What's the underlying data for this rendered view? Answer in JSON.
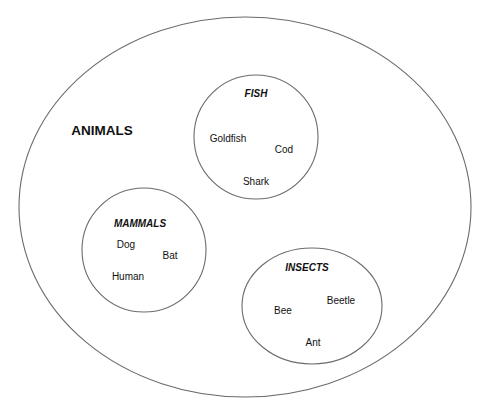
{
  "diagram": {
    "type": "euler-set-diagram",
    "outer_set": {
      "label": "ANIMALS",
      "label_pos": [
        102,
        131
      ],
      "shape": {
        "cx": 245,
        "cy": 207,
        "rx": 226,
        "ry": 190
      }
    },
    "subsets": [
      {
        "id": "fish",
        "label": "FISH",
        "label_pos": [
          256,
          94
        ],
        "shape": {
          "cx": 256,
          "cy": 137,
          "rx": 62,
          "ry": 62
        },
        "members": [
          {
            "name": "Goldfish",
            "pos": [
              228,
              139
            ]
          },
          {
            "name": "Cod",
            "pos": [
              284,
              150
            ]
          },
          {
            "name": "Shark",
            "pos": [
              256,
              182
            ]
          }
        ]
      },
      {
        "id": "mammals",
        "label": "MAMMALS",
        "label_pos": [
          140,
          224
        ],
        "shape": {
          "cx": 144,
          "cy": 250,
          "rx": 62,
          "ry": 62
        },
        "members": [
          {
            "name": "Dog",
            "pos": [
              126,
              245
            ]
          },
          {
            "name": "Bat",
            "pos": [
              170,
              256
            ]
          },
          {
            "name": "Human",
            "pos": [
              128,
              277
            ]
          }
        ]
      },
      {
        "id": "insects",
        "label": "INSECTS",
        "label_pos": [
          307,
          268
        ],
        "shape": {
          "cx": 312,
          "cy": 306,
          "rx": 70,
          "ry": 58
        },
        "members": [
          {
            "name": "Bee",
            "pos": [
              283,
              311
            ]
          },
          {
            "name": "Beetle",
            "pos": [
              341,
              301
            ]
          },
          {
            "name": "Ant",
            "pos": [
              313,
              343
            ]
          }
        ]
      }
    ]
  },
  "colors": {
    "stroke": "#6b6b6b",
    "text": "#111111",
    "background": "#ffffff"
  }
}
